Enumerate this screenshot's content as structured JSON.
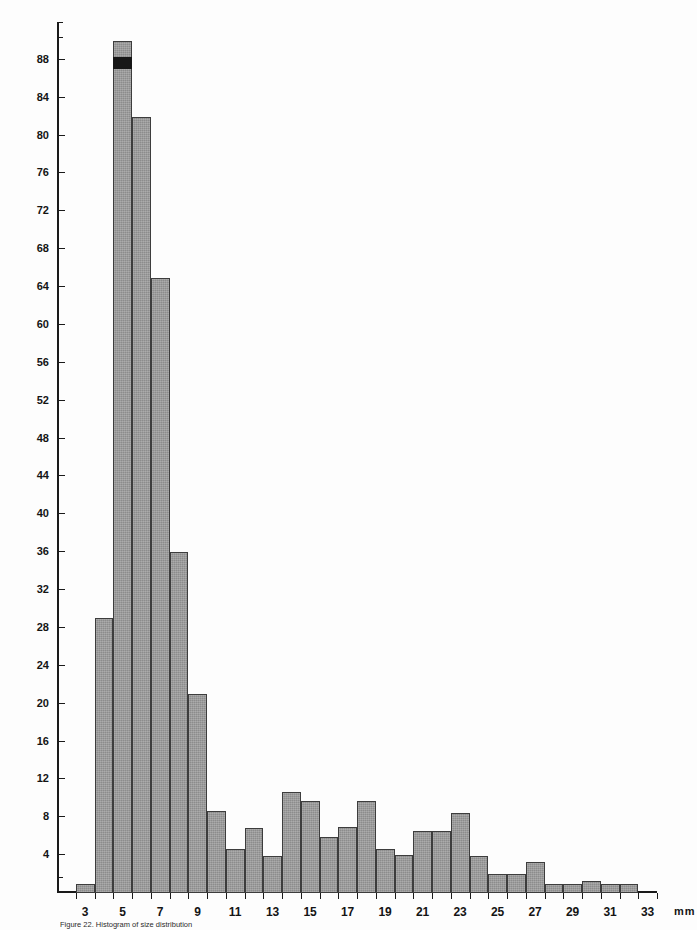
{
  "figure": {
    "caption": "Figure 22. Histogram of size distribution",
    "unit_label": "mm"
  },
  "chart_data": {
    "type": "bar",
    "title": "",
    "subtitle": "",
    "xlabel": "mm",
    "ylabel": "",
    "grid": false,
    "legend": null,
    "xlim": [
      1.5,
      33.5
    ],
    "ylim": [
      0,
      92
    ],
    "y_tick_step": 4,
    "y_ticks": [
      4,
      8,
      12,
      16,
      20,
      24,
      28,
      32,
      36,
      40,
      44,
      48,
      52,
      56,
      60,
      64,
      68,
      72,
      76,
      80,
      84,
      88
    ],
    "y_tick_labels": [
      "4",
      "8",
      "12",
      "16",
      "20",
      "24",
      "28",
      "32",
      "36",
      "40",
      "44",
      "48",
      "52",
      "56",
      "60",
      "64",
      "68",
      "72",
      "76",
      "80",
      "84",
      "88"
    ],
    "x_ticks": [
      3,
      5,
      7,
      9,
      11,
      13,
      15,
      17,
      19,
      21,
      23,
      25,
      27,
      29,
      31,
      33
    ],
    "x_tick_labels": [
      "3",
      "5",
      "7",
      "9",
      "11",
      "13",
      "15",
      "17",
      "19",
      "21",
      "23",
      "25",
      "27",
      "29",
      "31",
      "33"
    ],
    "bin_width": 1,
    "categories": [
      2,
      3,
      4,
      5,
      6,
      7,
      8,
      9,
      10,
      11,
      12,
      13,
      14,
      15,
      16,
      17,
      18,
      19,
      20,
      21,
      22,
      23,
      24,
      25,
      26,
      27,
      28,
      29,
      30,
      31,
      32,
      33
    ],
    "values": [
      0,
      1,
      29,
      90,
      82,
      65,
      36,
      21,
      8.7,
      4.6,
      6.9,
      3.9,
      10.7,
      9.7,
      5.9,
      7,
      9.7,
      4.7,
      4,
      6.6,
      6.6,
      8.5,
      3.9,
      2,
      2,
      3.3,
      1,
      1,
      1.3,
      1,
      1,
      0
    ],
    "annotations": [
      {
        "kind": "dark-band",
        "category": 5,
        "from": 87,
        "to": 88.3,
        "note": "dark horizontal band near top of tallest bar"
      }
    ],
    "colors": {
      "bar_fill": "#8c8c8c",
      "bar_edge": "#3d3d3d",
      "axis": "#1a1a1a",
      "text": "#141414",
      "background": "#fdfdfd"
    }
  }
}
